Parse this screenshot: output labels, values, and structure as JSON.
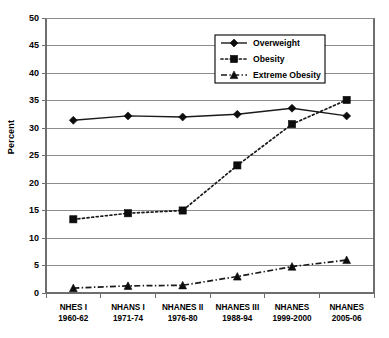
{
  "chart_data": {
    "type": "line",
    "title": "",
    "xlabel": "",
    "ylabel": "Percent",
    "ylim": [
      0,
      50
    ],
    "ytick_step": 5,
    "yticks": [
      0,
      5,
      10,
      15,
      20,
      25,
      30,
      35,
      40,
      45,
      50
    ],
    "grid": true,
    "legend_position": "top-right",
    "categories": [
      "NHES I\n1960-62",
      "NHANS I\n1971-74",
      "NHANES II\n1976-80",
      "NHANES III\n1988-94",
      "NHANES\n1999-2000",
      "NHANES\n2005-06"
    ],
    "category_lines": [
      [
        "NHES I",
        "1960-62"
      ],
      [
        "NHANS I",
        "1971-74"
      ],
      [
        "NHANES II",
        "1976-80"
      ],
      [
        "NHANES III",
        "1988-94"
      ],
      [
        "NHANES",
        "1999-2000"
      ],
      [
        "NHANES",
        "2005-06"
      ]
    ],
    "series": [
      {
        "name": "Overweight",
        "marker": "diamond",
        "linestyle": "solid",
        "color": "#0d0d0d",
        "values": [
          31.4,
          32.2,
          32.0,
          32.5,
          33.6,
          32.2
        ]
      },
      {
        "name": "Obesity",
        "marker": "square",
        "linestyle": "dotted",
        "color": "#0d0d0d",
        "values": [
          13.4,
          14.5,
          15.0,
          23.2,
          30.7,
          35.1
        ]
      },
      {
        "name": "Extreme Obesity",
        "marker": "triangle",
        "linestyle": "dash-dot",
        "color": "#0d0d0d",
        "values": [
          0.9,
          1.3,
          1.4,
          3.0,
          4.8,
          6.0
        ]
      }
    ]
  },
  "legend": {
    "entries": [
      {
        "label": "Overweight"
      },
      {
        "label": "Obesity"
      },
      {
        "label": "Extreme Obesity"
      }
    ]
  },
  "axes": {
    "y_title": "Percent",
    "y_tick_labels": [
      "50",
      "45",
      "40",
      "35",
      "30",
      "25",
      "20",
      "15",
      "10",
      "5",
      "0"
    ]
  },
  "colors": {
    "ink": "#0d0d0d",
    "gridline": "#8c8c8c",
    "axis": "#6e6e6e",
    "background": "#ffffff"
  }
}
